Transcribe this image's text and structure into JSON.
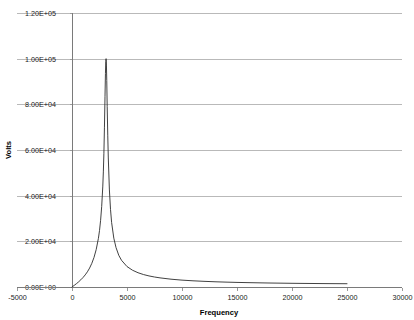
{
  "chart_data": {
    "type": "line",
    "title": "",
    "xlabel": "Frequency",
    "ylabel": "Volts",
    "xlim": [
      -5000,
      30000
    ],
    "ylim": [
      0,
      120000
    ],
    "xticks": [
      -5000,
      0,
      5000,
      10000,
      15000,
      20000,
      25000,
      30000
    ],
    "xtick_labels": [
      "-5000",
      "0",
      "5000",
      "10000",
      "15000",
      "20000",
      "25000",
      "30000"
    ],
    "yticks": [
      0,
      20000,
      40000,
      60000,
      80000,
      100000,
      120000
    ],
    "ytick_labels": [
      "0.00E+00",
      "2.00E+04",
      "4.00E+04",
      "6.00E+04",
      "8.00E+04",
      "1.00E+05",
      "1.20E+05"
    ],
    "grid": "horizontal",
    "legend": "none",
    "series": [
      {
        "name": "Volts",
        "color": "#2b2b2b",
        "resonance_frequency": 3100,
        "peak_value": 100000,
        "x": [
          0,
          200,
          400,
          600,
          800,
          1000,
          1200,
          1400,
          1600,
          1800,
          2000,
          2200,
          2400,
          2500,
          2600,
          2700,
          2800,
          2850,
          2900,
          2950,
          3000,
          3040,
          3070,
          3090,
          3100,
          3110,
          3130,
          3160,
          3200,
          3250,
          3300,
          3400,
          3500,
          3600,
          3800,
          4000,
          4250,
          4500,
          5000,
          5500,
          6000,
          6500,
          7000,
          7500,
          8000,
          9000,
          10000,
          11000,
          12000,
          13000,
          14000,
          15000,
          16000,
          17000,
          18000,
          19000,
          20000,
          21000,
          22000,
          23000,
          24000,
          25000
        ],
        "y": [
          0,
          700,
          1450,
          2250,
          3150,
          4150,
          5300,
          6650,
          8300,
          10350,
          12950,
          16400,
          21300,
          24700,
          29200,
          35300,
          44200,
          50400,
          58600,
          70000,
          83500,
          93500,
          98800,
          99900,
          100000,
          99600,
          97200,
          90500,
          79000,
          66500,
          56500,
          42500,
          34000,
          28300,
          21400,
          17300,
          13900,
          11700,
          8950,
          7350,
          6250,
          5450,
          4850,
          4380,
          4000,
          3420,
          3010,
          2710,
          2480,
          2290,
          2140,
          2010,
          1910,
          1820,
          1740,
          1680,
          1620,
          1570,
          1530,
          1490,
          1460,
          1430
        ]
      }
    ]
  },
  "axes": {
    "ylabel_text": "Volts",
    "xlabel_text": "Frequency"
  }
}
